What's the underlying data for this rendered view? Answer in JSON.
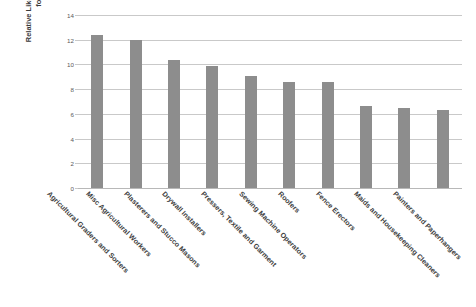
{
  "chart_data": {
    "type": "bar",
    "title": "",
    "xlabel": "",
    "ylabel": "Relative Likelihood of Employment in Occupation for Less-Educated Noncitizen",
    "ylim": [
      0,
      14
    ],
    "ytick_labels": [
      "14",
      "12",
      "10",
      "8",
      "6",
      "4",
      "2",
      "0"
    ],
    "ytick_values": [
      14,
      12,
      10,
      8,
      6,
      4,
      2,
      0
    ],
    "grid": true,
    "legend": false,
    "bar_color": "#8d8d8d",
    "gridline_color": "#c9c9c9",
    "categories": [
      "Agricultural Graders and Sorters",
      "Misc Agricultural Workers",
      "Plasterers and Stucco Masons",
      "Drywall Installers",
      "Pressers, Textile and Garment",
      "Sewing Machine Operators",
      "Roofers",
      "Fence Erectors",
      "Maids and Housekeeping Cleaners",
      "Painters and Paperhangers"
    ],
    "values": [
      12.4,
      12.0,
      10.4,
      9.85,
      9.1,
      8.6,
      8.6,
      6.6,
      6.5,
      6.35
    ]
  },
  "y_axis": {
    "title_line_1": "Relative Likelihood of Employment in Occupation",
    "title_line_2": "for Less-Educated Noncitizen"
  }
}
